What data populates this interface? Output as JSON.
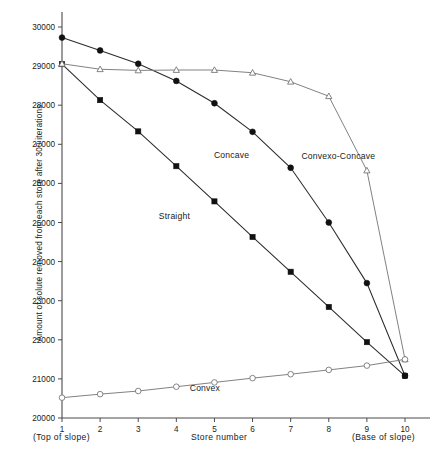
{
  "chart_data": {
    "type": "line",
    "title": "",
    "xlabel": "Store  number",
    "ylabel": "Amount of solute removed from each store after 300  iterations",
    "xlabel_left_note": "(Top of slope)",
    "xlabel_right_note": "(Base of slope)",
    "x": [
      1,
      2,
      3,
      4,
      5,
      6,
      7,
      8,
      9,
      10
    ],
    "xtick_labels": [
      "1",
      "2",
      "3",
      "4",
      "5",
      "6",
      "7",
      "8",
      "9",
      "10"
    ],
    "ytick_labels": [
      "20000",
      "21000",
      "22000",
      "23000",
      "24000",
      "25000",
      "26000",
      "27000",
      "28000",
      "29000",
      "30000"
    ],
    "yticks": [
      20000,
      21000,
      22000,
      23000,
      24000,
      25000,
      26000,
      27000,
      28000,
      29000,
      30000
    ],
    "xlim": [
      0.72,
      10.55
    ],
    "ylim": [
      20000,
      30200
    ],
    "grid": false,
    "legend": "inline-annotations",
    "series": [
      {
        "name": "Concave",
        "marker": "filled-circle",
        "label_x": 5.45,
        "label_y": 26650,
        "values": [
          29730,
          29400,
          29060,
          28620,
          28050,
          27320,
          26400,
          25000,
          23450,
          21080
        ]
      },
      {
        "name": "Straight",
        "marker": "filled-square",
        "label_x": 3.95,
        "label_y": 25100,
        "values": [
          29050,
          28130,
          27330,
          26440,
          25540,
          24630,
          23740,
          22840,
          21940,
          21080
        ]
      },
      {
        "name": "Convexo-Concave",
        "marker": "open-triangle",
        "label_x": 8.25,
        "label_y": 26630,
        "values": [
          29060,
          28920,
          28890,
          28900,
          28900,
          28830,
          28600,
          28230,
          26330,
          21500
        ]
      },
      {
        "name": "Convex",
        "marker": "open-circle",
        "label_x": 4.75,
        "label_y": 20700,
        "values": [
          20520,
          20610,
          20690,
          20800,
          20910,
          21020,
          21120,
          21230,
          21340,
          21500
        ]
      }
    ]
  }
}
